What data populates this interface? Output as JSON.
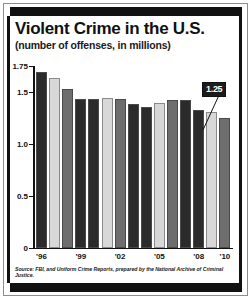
{
  "figure": {
    "title": "Violent Crime in the U.S.",
    "subtitle": "(number of offenses, in millions)",
    "source": "Source: FBI, and Uniform Crime Reports, prepared by the National Archive of Criminal Justice.",
    "callout_label": "1.25"
  },
  "colors": {
    "bar_dark": "#2b2b2b",
    "bar_light": "#d8d8d8",
    "bar_mid": "#6e6e6e",
    "frame": "#111111",
    "background": "#ffffff"
  },
  "chart_data": {
    "type": "bar",
    "title": "Violent Crime in the U.S.",
    "subtitle": "(number of offenses, in millions)",
    "xlabel": "",
    "ylabel": "",
    "ylim": [
      0,
      1.75
    ],
    "grid": false,
    "legend": null,
    "ytick_labels": [
      "1.75",
      "1.5",
      "1.0",
      "0.5",
      "0"
    ],
    "ytick_values": [
      1.75,
      1.5,
      1.0,
      0.5,
      0
    ],
    "xtick_labels": [
      "'96",
      "'99",
      "'02",
      "'05",
      "'08",
      "'10"
    ],
    "xtick_indices": [
      0,
      3,
      6,
      9,
      12,
      14
    ],
    "categories": [
      "'96",
      "'97",
      "'98",
      "'99",
      "'00",
      "'01",
      "'02",
      "'03",
      "'04",
      "'05",
      "'06",
      "'07",
      "'08",
      "'09",
      "'10"
    ],
    "values": [
      1.69,
      1.63,
      1.53,
      1.43,
      1.43,
      1.44,
      1.43,
      1.38,
      1.36,
      1.39,
      1.42,
      1.42,
      1.33,
      1.31,
      1.25
    ],
    "bar_shades": [
      "dark",
      "light",
      "mid",
      "dark",
      "dark",
      "light",
      "mid",
      "dark",
      "dark",
      "light",
      "mid",
      "dark",
      "dark",
      "light",
      "mid"
    ],
    "annotations": [
      {
        "label": "1.25",
        "category": "'10",
        "value": 1.25
      }
    ]
  }
}
